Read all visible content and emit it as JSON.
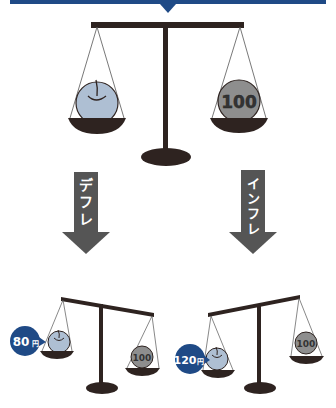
{
  "header": {
    "banner_color": "#1f4a86"
  },
  "colors": {
    "beam": "#2e2320",
    "pan": "#2e2320",
    "apple": "#aebfd3",
    "coin": "#8e8e8e",
    "arrow": "#555555",
    "badge": "#1f4a86",
    "string": "#555555"
  },
  "top_scale": {
    "left_item": "apple",
    "right_item": "coin",
    "coin_label": "100"
  },
  "arrows": [
    {
      "label": "デフレ",
      "chars": [
        "デ",
        "フ",
        "レ"
      ]
    },
    {
      "label": "インフレ",
      "chars": [
        "イ",
        "ン",
        "フ",
        "レ"
      ]
    }
  ],
  "deflation_scale": {
    "coin_label": "100",
    "price_number": "80",
    "price_unit": "円"
  },
  "inflation_scale": {
    "coin_label": "100",
    "price_number": "120",
    "price_unit": "円"
  }
}
